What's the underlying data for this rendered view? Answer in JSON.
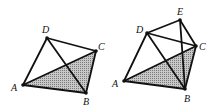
{
  "figures": [
    {
      "id": "left",
      "vertices": {
        "A": {
          "x": 23,
          "y": 85,
          "label": "A",
          "lx": 11,
          "ly": 91
        },
        "B": {
          "x": 86,
          "y": 93,
          "label": "B",
          "lx": 83,
          "ly": 105
        },
        "C": {
          "x": 96,
          "y": 51,
          "label": "C",
          "lx": 98,
          "ly": 50
        },
        "D": {
          "x": 47,
          "y": 38,
          "label": "D",
          "lx": 42,
          "ly": 33
        }
      },
      "shaded": [
        "A",
        "B",
        "C"
      ],
      "edges": [
        [
          "A",
          "D"
        ],
        [
          "D",
          "C"
        ],
        [
          "C",
          "B"
        ],
        [
          "B",
          "A"
        ],
        [
          "A",
          "C"
        ],
        [
          "D",
          "B"
        ]
      ]
    },
    {
      "id": "right",
      "vertices": {
        "A": {
          "x": 124,
          "y": 81,
          "label": "A",
          "lx": 112,
          "ly": 87
        },
        "B": {
          "x": 185,
          "y": 89,
          "label": "B",
          "lx": 184,
          "ly": 102
        },
        "C": {
          "x": 196,
          "y": 46,
          "label": "C",
          "lx": 199,
          "ly": 50
        },
        "D": {
          "x": 147,
          "y": 33,
          "label": "D",
          "lx": 136,
          "ly": 33
        },
        "E": {
          "x": 180,
          "y": 20,
          "label": "E",
          "lx": 177,
          "ly": 15
        }
      },
      "shaded": [
        "A",
        "B",
        "C"
      ],
      "edges": [
        [
          "A",
          "D"
        ],
        [
          "D",
          "E"
        ],
        [
          "E",
          "C"
        ],
        [
          "D",
          "C"
        ],
        [
          "C",
          "B"
        ],
        [
          "B",
          "A"
        ],
        [
          "A",
          "C"
        ],
        [
          "D",
          "B"
        ],
        [
          "E",
          "B"
        ]
      ]
    }
  ],
  "colors": {
    "stroke": "#111111",
    "shade_bg": "#c8c8c8",
    "shade_dot": "#7a7a7a"
  }
}
